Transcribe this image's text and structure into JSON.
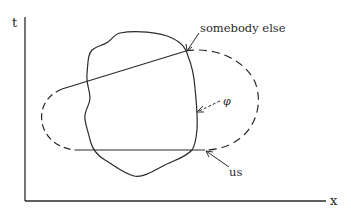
{
  "diagram": {
    "axes": {
      "y_label": "t",
      "x_label": "x"
    },
    "annotations": {
      "somebody_else": "somebody else",
      "us": "us",
      "phi": "φ"
    },
    "colors": {
      "stroke": "#2a2a2a",
      "background": "#ffffff"
    }
  }
}
